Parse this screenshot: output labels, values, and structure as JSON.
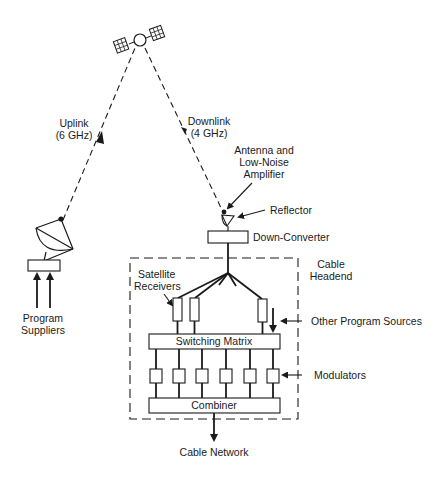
{
  "diagram": {
    "title": "",
    "satellite": {
      "name": "satellite"
    },
    "uplink": {
      "line1": "Uplink",
      "line2": "(6 GHz)"
    },
    "downlink": {
      "line1": "Downlink",
      "line2": "(4 GHz)"
    },
    "antenna_label": {
      "line1": "Antenna and",
      "line2": "Low-Noise",
      "line3": "Amplifier"
    },
    "reflector_label": "Reflector",
    "down_converter_label": "Down-Converter",
    "headend_label": {
      "line1": "Cable",
      "line2": "Headend"
    },
    "receivers_label": {
      "line1": "Satellite",
      "line2": "Receivers"
    },
    "other_sources_label": "Other Program Sources",
    "switching_matrix_label": "Switching Matrix",
    "modulators_label": "Modulators",
    "combiner_label": "Combiner",
    "cable_network_label": "Cable Network",
    "program_suppliers_label": {
      "line1": "Program",
      "line2": "Suppliers"
    },
    "modulator_count": 6,
    "receiver_count": 3,
    "colors": {
      "ink": "#1a1a1a",
      "background": "#ffffff"
    }
  }
}
